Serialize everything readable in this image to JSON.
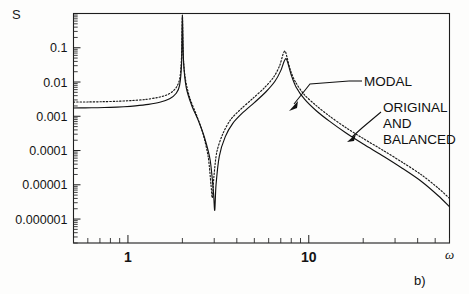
{
  "figure": {
    "panel_label": "b)",
    "y_axis_title": "S",
    "x_axis_title": "ω"
  },
  "annotations": [
    {
      "id": "modal",
      "text": "MODAL"
    },
    {
      "id": "original_line1",
      "text": "ORIGINAL"
    },
    {
      "id": "original_line2",
      "text": "AND"
    },
    {
      "id": "original_line3",
      "text": "BALANCED"
    }
  ],
  "chart_data": {
    "type": "line",
    "title": "",
    "subtitle": "",
    "xlabel": "ω",
    "ylabel": "S",
    "xscale": "log",
    "yscale": "log",
    "xlim": [
      0.5,
      60
    ],
    "ylim": [
      2e-07,
      1.0
    ],
    "grid": false,
    "legend_position": "inline-annotations",
    "xtick_labels": [
      "1",
      "10"
    ],
    "xtick_values": [
      1,
      10
    ],
    "ytick_labels": [
      "0.1",
      "0.01",
      "0.001",
      "0.0001",
      "0.00001",
      "0.000001"
    ],
    "ytick_values": [
      0.1,
      0.01,
      0.001,
      0.0001,
      1e-05,
      1e-06
    ],
    "series": [
      {
        "name": "ORIGINAL AND BALANCED",
        "style": "solid",
        "points": [
          [
            0.5,
            0.00175
          ],
          [
            0.58,
            0.00176
          ],
          [
            0.68,
            0.00178
          ],
          [
            0.8,
            0.00182
          ],
          [
            0.95,
            0.0019
          ],
          [
            1.1,
            0.00201
          ],
          [
            1.3,
            0.00222
          ],
          [
            1.5,
            0.00256
          ],
          [
            1.7,
            0.00325
          ],
          [
            1.85,
            0.0047
          ],
          [
            1.93,
            0.008
          ],
          [
            1.98,
            0.035
          ],
          [
            2.0,
            0.85
          ],
          [
            2.03,
            0.04
          ],
          [
            2.1,
            0.007
          ],
          [
            2.25,
            0.0021
          ],
          [
            2.45,
            0.00075
          ],
          [
            2.65,
            0.00024
          ],
          [
            2.85,
            5.2e-05
          ],
          [
            2.97,
            6.2e-06
          ],
          [
            3.02,
            1.8e-06
          ],
          [
            3.07,
            1e-05
          ],
          [
            3.2,
            6.8e-05
          ],
          [
            3.45,
            0.00025
          ],
          [
            3.8,
            0.00062
          ],
          [
            4.3,
            0.00125
          ],
          [
            5.0,
            0.0025
          ],
          [
            5.8,
            0.0052
          ],
          [
            6.5,
            0.0105
          ],
          [
            7.0,
            0.0215
          ],
          [
            7.3,
            0.04
          ],
          [
            7.5,
            0.048
          ],
          [
            7.7,
            0.033
          ],
          [
            8.0,
            0.016
          ],
          [
            8.5,
            0.0072
          ],
          [
            9.5,
            0.0031
          ],
          [
            11.0,
            0.00145
          ],
          [
            13.0,
            0.00072
          ],
          [
            16.0,
            0.00033
          ],
          [
            20.0,
            0.000155
          ],
          [
            26.0,
            6.7e-05
          ],
          [
            33.0,
            3e-05
          ],
          [
            42.0,
            1.25e-05
          ],
          [
            52.0,
            4.8e-06
          ],
          [
            60.0,
            2.3e-06
          ]
        ]
      },
      {
        "name": "MODAL",
        "style": "dotted",
        "points": [
          [
            0.5,
            0.0026
          ],
          [
            0.6,
            0.00262
          ],
          [
            0.72,
            0.00266
          ],
          [
            0.88,
            0.00275
          ],
          [
            1.05,
            0.00288
          ],
          [
            1.25,
            0.0031
          ],
          [
            1.45,
            0.0035
          ],
          [
            1.62,
            0.0041
          ],
          [
            1.76,
            0.0052
          ],
          [
            1.87,
            0.0076
          ],
          [
            1.94,
            0.014
          ],
          [
            1.98,
            0.06
          ],
          [
            2.0,
            0.9
          ],
          [
            2.02,
            0.06
          ],
          [
            2.08,
            0.012
          ],
          [
            2.2,
            0.0034
          ],
          [
            2.4,
            0.00105
          ],
          [
            2.6,
            0.00031
          ],
          [
            2.78,
            6.4e-05
          ],
          [
            2.88,
            9.8e-06
          ],
          [
            2.93,
            4.2e-06
          ],
          [
            2.99,
            1.8e-05
          ],
          [
            3.1,
            9e-05
          ],
          [
            3.35,
            0.00031
          ],
          [
            3.7,
            0.0008
          ],
          [
            4.2,
            0.0016
          ],
          [
            4.9,
            0.0033
          ],
          [
            5.7,
            0.0069
          ],
          [
            6.4,
            0.014
          ],
          [
            6.9,
            0.03
          ],
          [
            7.2,
            0.064
          ],
          [
            7.4,
            0.08
          ],
          [
            7.6,
            0.05
          ],
          [
            7.9,
            0.023
          ],
          [
            8.4,
            0.0105
          ],
          [
            9.4,
            0.0044
          ],
          [
            11.0,
            0.00205
          ],
          [
            13.0,
            0.00102
          ],
          [
            16.0,
            0.00047
          ],
          [
            20.0,
            0.000225
          ],
          [
            26.0,
            9.8e-05
          ],
          [
            33.0,
            4.5e-05
          ],
          [
            42.0,
            1.95e-05
          ],
          [
            52.0,
            8e-06
          ],
          [
            60.0,
            4e-06
          ]
        ]
      }
    ]
  }
}
